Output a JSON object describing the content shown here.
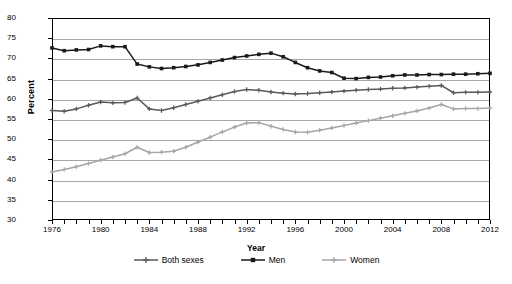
{
  "chart_data": {
    "type": "line",
    "title": "",
    "xlabel": "Year",
    "ylabel": "Percent",
    "xlim": [
      1976,
      2012
    ],
    "ylim": [
      30,
      80
    ],
    "ytick_step": 5,
    "yticks": [
      30,
      35,
      40,
      45,
      50,
      55,
      60,
      65,
      70,
      75,
      80
    ],
    "xticks_labeled": [
      1976,
      1980,
      1984,
      1988,
      1992,
      1996,
      2000,
      2004,
      2008,
      2012
    ],
    "x": [
      1976,
      1977,
      1978,
      1979,
      1980,
      1981,
      1982,
      1983,
      1984,
      1985,
      1986,
      1987,
      1988,
      1989,
      1990,
      1991,
      1992,
      1993,
      1994,
      1995,
      1996,
      1997,
      1998,
      1999,
      2000,
      2001,
      2002,
      2003,
      2004,
      2005,
      2006,
      2007,
      2008,
      2009,
      2010,
      2011,
      2012
    ],
    "grid": true,
    "grid_axis": "y",
    "legend_position": "bottom",
    "series": [
      {
        "name": "Both sexes",
        "color": "#595959",
        "marker": "plus",
        "values": [
          57.1,
          56.9,
          57.5,
          58.4,
          59.2,
          59.0,
          59.1,
          60.2,
          57.5,
          57.1,
          57.8,
          58.6,
          59.4,
          60.2,
          61.0,
          61.8,
          62.3,
          62.1,
          61.7,
          61.4,
          61.2,
          61.3,
          61.5,
          61.7,
          61.9,
          62.1,
          62.3,
          62.4,
          62.6,
          62.7,
          62.9,
          63.1,
          63.3,
          61.5,
          61.6,
          61.6,
          61.7
        ]
      },
      {
        "name": "Men",
        "color": "#1a1a1a",
        "marker": "square",
        "values": [
          72.6,
          71.9,
          72.1,
          72.2,
          73.1,
          72.9,
          72.9,
          68.6,
          67.9,
          67.5,
          67.7,
          68.0,
          68.4,
          69.0,
          69.6,
          70.2,
          70.6,
          71.0,
          71.3,
          70.4,
          69.0,
          67.7,
          66.9,
          66.5,
          65.1,
          65.0,
          65.3,
          65.4,
          65.7,
          65.9,
          65.9,
          66.0,
          66.0,
          66.1,
          66.1,
          66.2,
          66.3
        ]
      },
      {
        "name": "Women",
        "color": "#a6a6a6",
        "marker": "plus",
        "values": [
          41.9,
          42.5,
          43.2,
          44.0,
          44.8,
          45.6,
          46.4,
          48.0,
          46.7,
          46.8,
          47.0,
          48.0,
          49.3,
          50.5,
          51.8,
          53.0,
          54.0,
          54.1,
          53.2,
          52.4,
          51.8,
          51.7,
          52.2,
          52.8,
          53.4,
          54.0,
          54.6,
          55.2,
          55.8,
          56.4,
          57.0,
          57.7,
          58.6,
          57.5,
          57.6,
          57.6,
          57.7
        ]
      }
    ]
  },
  "axes": {
    "y_title": "Percent",
    "x_title": "Year"
  },
  "legend": {
    "items": [
      {
        "label": "Both sexes"
      },
      {
        "label": "Men"
      },
      {
        "label": "Women"
      }
    ]
  }
}
